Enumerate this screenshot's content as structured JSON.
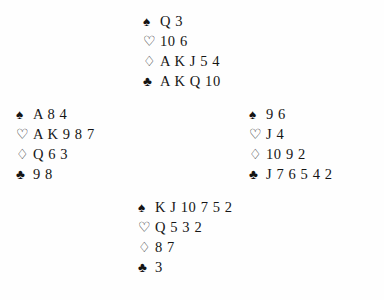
{
  "diagram": {
    "type": "bridge-deal",
    "suit_order": [
      "spades",
      "hearts",
      "diamonds",
      "clubs"
    ],
    "symbols": {
      "spades": "♠",
      "hearts": "♡",
      "diamonds": "♢",
      "clubs": "♣"
    },
    "symbol_names": {
      "spades": "spade-suit-icon",
      "hearts": "heart-suit-icon",
      "diamonds": "diamond-suit-icon",
      "clubs": "club-suit-icon"
    },
    "colors": {
      "ink": "#151515",
      "background": "#fefefe"
    },
    "hands": {
      "north": {
        "position": "North",
        "spades": "Q 3",
        "hearts": "10 6",
        "diamonds": "A K J 5 4",
        "clubs": "A K Q 10"
      },
      "west": {
        "position": "West",
        "spades": "A 8 4",
        "hearts": "A K 9 8 7",
        "diamonds": "Q 6 3",
        "clubs": "9 8"
      },
      "east": {
        "position": "East",
        "spades": "9 6",
        "hearts": "J 4",
        "diamonds": "10 9 2",
        "clubs": "J 7 6 5 4 2"
      },
      "south": {
        "position": "South",
        "spades": "K J 10 7 5 2",
        "hearts": "Q 5 3 2",
        "diamonds": "8 7",
        "clubs": "3"
      }
    }
  }
}
